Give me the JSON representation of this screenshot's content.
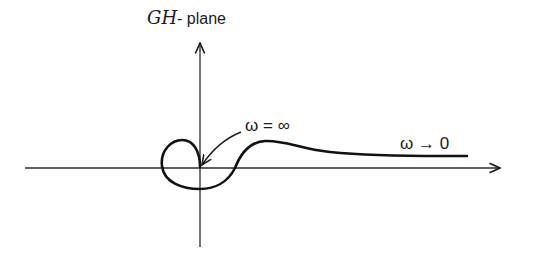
{
  "diagram": {
    "type": "nyquist-plot",
    "title": {
      "italic_part": "GH",
      "plain_part": "- plane"
    },
    "labels": {
      "omega_infinity": "ω = ∞",
      "omega_zero": "ω → 0"
    },
    "axes": {
      "real_axis": "horizontal, arrow pointing right",
      "imaginary_axis": "vertical, arrow pointing up"
    },
    "curve_description": "Nyquist locus starting at ω → 0 on the right slightly above real axis, rising in a bump, crossing the real axis, looping around the origin below and to the left, ending at the origin at ω = ∞",
    "colors": {
      "ink": "#1a1a1a",
      "background": "#ffffff"
    }
  }
}
